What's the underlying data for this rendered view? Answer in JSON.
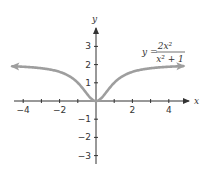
{
  "chart_data": {
    "type": "line",
    "title": "",
    "equation": {
      "lhs": "y =",
      "numerator": "2x²",
      "denominator": "x² + 1"
    },
    "xlabel": "x",
    "ylabel": "y",
    "xlim": [
      -4.3,
      5
    ],
    "ylim": [
      -3.3,
      3.9
    ],
    "xticks": [
      -4,
      -3,
      -2,
      -1,
      1,
      2,
      3,
      4
    ],
    "xtick_labels": [
      "-4",
      "-2",
      "2",
      "4"
    ],
    "yticks": [
      -3,
      -2,
      -1,
      1,
      2,
      3
    ],
    "ytick_labels": [
      "-3",
      "-2",
      "-1",
      "1",
      "2",
      "3"
    ],
    "grid": false,
    "series": [
      {
        "name": "y = 2x^2/(x^2+1)",
        "color": "#9e9e9e",
        "x": [
          -5,
          -4,
          -3,
          -2,
          -1,
          -0.5,
          0,
          0.5,
          1,
          2,
          3,
          4,
          5
        ],
        "y": [
          1.92,
          1.88,
          1.8,
          1.6,
          1.0,
          0.4,
          0,
          0.4,
          1.0,
          1.6,
          1.8,
          1.88,
          1.92
        ]
      }
    ]
  }
}
